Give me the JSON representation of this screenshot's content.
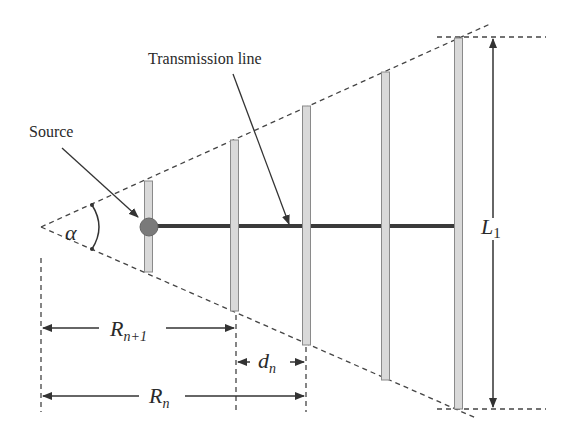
{
  "diagram": {
    "labels": {
      "transmission_line": "Transmission line",
      "source": "Source",
      "alpha": "α",
      "L": "L",
      "L_sub": "1",
      "R_next": "R",
      "R_next_sub": "n+1",
      "d": "d",
      "d_sub": "n",
      "R": "R",
      "R_sub": "n"
    },
    "colors": {
      "line": "#333333",
      "dashed": "#444444",
      "element_fill": "#d9d9d9",
      "element_stroke": "#8a8a8a",
      "source_fill": "#7a7a7a",
      "feed_line": "#3a3a3a"
    },
    "elements": [
      {
        "x": 148,
        "top": 181,
        "bottom": 272
      },
      {
        "x": 234,
        "top": 140,
        "bottom": 311
      },
      {
        "x": 306,
        "top": 106,
        "bottom": 345
      },
      {
        "x": 385,
        "top": 72,
        "bottom": 380
      },
      {
        "x": 458,
        "top": 38,
        "bottom": 409
      }
    ]
  }
}
